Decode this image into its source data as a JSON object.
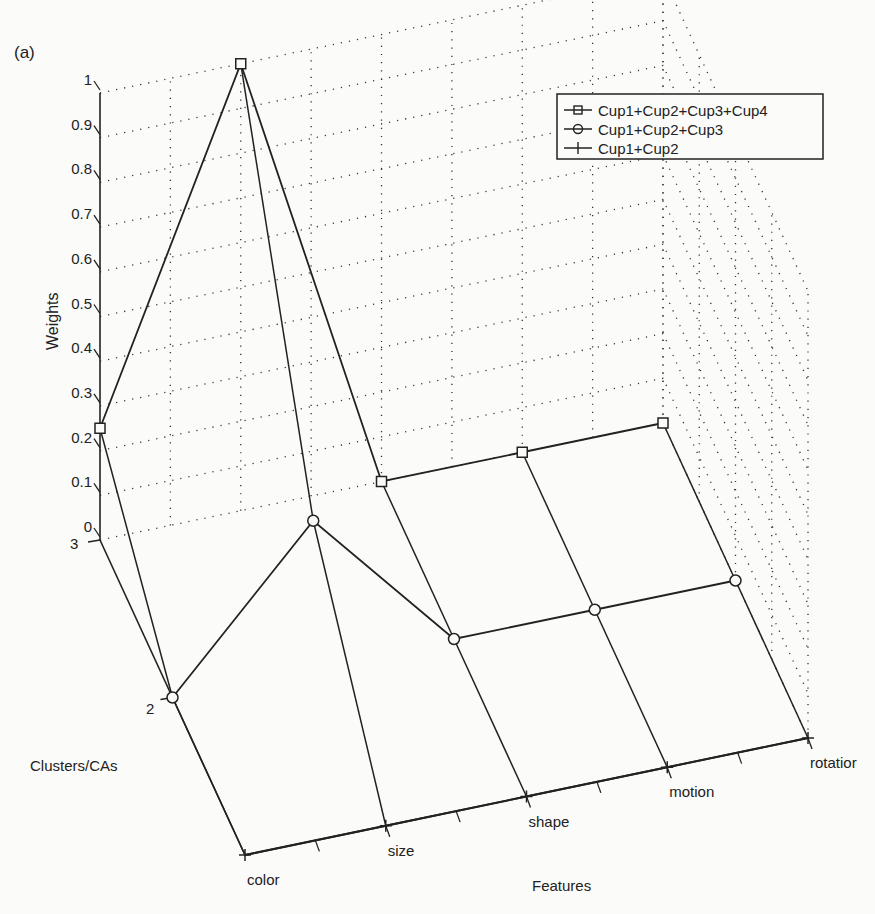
{
  "panel_label": "(a)",
  "chart_data": {
    "type": "line",
    "subtype": "3d-waterfall",
    "title": "",
    "xlabel": "Features",
    "ylabel": "Clusters/CAs",
    "zlabel": "Weights",
    "categories": [
      "color",
      "size",
      "shape",
      "motion",
      "rotation"
    ],
    "feature_tick_labels": [
      "color",
      "size",
      "shape",
      "motion",
      "rotatior"
    ],
    "cluster_ticks": [
      "2",
      "3"
    ],
    "weight_ticks": [
      "0",
      "0.1",
      "0.2",
      "0.3",
      "0.4",
      "0.5",
      "0.6",
      "0.7",
      "0.8",
      "0.9",
      "1"
    ],
    "zlim": [
      0,
      1
    ],
    "grid": true,
    "legend_position": "upper right",
    "series": [
      {
        "name": "Cup1+Cup2+Cup3+Cup4",
        "marker": "square",
        "cluster": 3,
        "values": [
          0.25,
          1.0,
          0.0,
          0.0,
          0.0
        ]
      },
      {
        "name": "Cup1+Cup2+Cup3",
        "marker": "circle",
        "cluster": 2,
        "values": [
          0.0,
          0.33,
          0.0,
          0.0,
          0.0
        ]
      },
      {
        "name": "Cup1+Cup2",
        "marker": "plus",
        "cluster": 1,
        "values": [
          0.0,
          0.0,
          0.0,
          0.0,
          0.0
        ]
      }
    ]
  }
}
